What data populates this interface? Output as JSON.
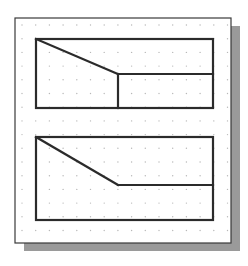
{
  "diagram": {
    "type": "orthographic-sketch",
    "background_color": "#ffffff",
    "frame": {
      "x": 15,
      "y": 18,
      "width": 216,
      "height": 225,
      "border_color": "#3a3a3a",
      "fill": "#ffffff",
      "shadow": {
        "dx": 9,
        "dy": 8,
        "color": "#9a9a9a"
      }
    },
    "grid": {
      "type": "dot",
      "origin_x": 22,
      "origin_y": 25,
      "spacing": 13.7,
      "cols": 16,
      "rows": 17,
      "dot_color": "#b8b8b8",
      "dot_radius": 0.7
    },
    "stroke_color": "#2b2b2b",
    "stroke_width": 2.2,
    "shapes": [
      {
        "name": "top-view-profile",
        "outline": {
          "x1": 36,
          "y1": 39,
          "x2": 213,
          "y2": 108
        },
        "lines": [
          {
            "name": "diagonal-edge",
            "x1": 36,
            "y1": 39,
            "x2": 118,
            "y2": 74
          },
          {
            "name": "horizontal-edge",
            "x1": 118,
            "y1": 74,
            "x2": 213,
            "y2": 74
          },
          {
            "name": "vertical-edge",
            "x1": 118,
            "y1": 74,
            "x2": 118,
            "y2": 108
          }
        ]
      },
      {
        "name": "bottom-view-profile",
        "outline": {
          "x1": 36,
          "y1": 137,
          "x2": 213,
          "y2": 220
        },
        "lines": [
          {
            "name": "diagonal-edge",
            "x1": 36,
            "y1": 137,
            "x2": 118,
            "y2": 185
          },
          {
            "name": "horizontal-edge",
            "x1": 118,
            "y1": 185,
            "x2": 213,
            "y2": 185
          }
        ]
      }
    ]
  }
}
